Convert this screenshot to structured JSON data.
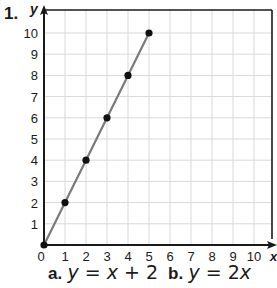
{
  "problem": {
    "number": "1.",
    "answers": [
      {
        "letter": "a.",
        "lhs": "y",
        "rel": "=",
        "rhs_var": "x",
        "rhs_rest": "+ 2"
      },
      {
        "letter": "b.",
        "lhs": "y",
        "rel": "=",
        "rhs_coef": "2",
        "rhs_var": "x"
      }
    ]
  },
  "colors": {
    "axis": "#1a1a1a",
    "grid": "#d9d9d9",
    "line": "#7a7a7a",
    "point": "#111111"
  },
  "chart_data": {
    "type": "line",
    "title": "",
    "xlabel": "x",
    "ylabel": "y",
    "xlim": [
      0,
      10
    ],
    "ylim": [
      0,
      10
    ],
    "grid": true,
    "x_ticks": [
      "0",
      "1",
      "2",
      "3",
      "4",
      "5",
      "6",
      "7",
      "8",
      "9",
      "10"
    ],
    "y_ticks": [
      "1",
      "2",
      "3",
      "4",
      "5",
      "6",
      "7",
      "8",
      "9",
      "10"
    ],
    "series": [
      {
        "name": "plotted line",
        "x": [
          0,
          1,
          2,
          3,
          4,
          5
        ],
        "y": [
          0,
          2,
          4,
          6,
          8,
          10
        ],
        "markers": true
      }
    ],
    "answer_choices": [
      "a. y = x + 2",
      "b. y = 2x"
    ]
  }
}
